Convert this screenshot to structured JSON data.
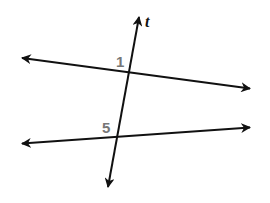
{
  "diagram": {
    "type": "parallel-lines-with-transversal",
    "colors": {
      "line": "#111111",
      "angle_label": "#777777",
      "background": "#ffffff"
    },
    "transversal": {
      "label": "t",
      "from": [
        107,
        192
      ],
      "to": [
        140,
        12
      ]
    },
    "lines": [
      {
        "name": "upper-line",
        "from": [
          17,
          57
        ],
        "to": [
          255,
          89
        ]
      },
      {
        "name": "lower-line",
        "from": [
          17,
          144
        ],
        "to": [
          255,
          127
        ]
      }
    ],
    "angle_labels": [
      {
        "text": "1",
        "x": 118,
        "y": 66
      },
      {
        "text": "5",
        "x": 103,
        "y": 132
      }
    ]
  }
}
